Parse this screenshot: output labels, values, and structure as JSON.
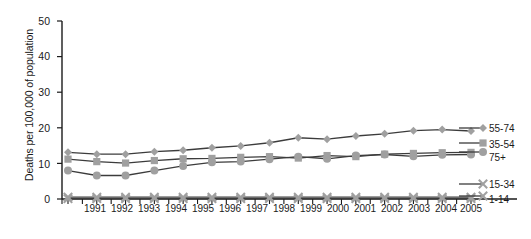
{
  "chart_data": {
    "type": "line",
    "title": "",
    "xlabel": "",
    "ylabel": "Deaths per 100,000 of population",
    "x": [
      1991,
      1992,
      1993,
      1994,
      1995,
      1996,
      1997,
      1998,
      1999,
      2000,
      2001,
      2002,
      2003,
      2004,
      2005
    ],
    "xtick_labels": [
      "1991",
      "1992",
      "1993",
      "1994",
      "1995",
      "1996",
      "1997",
      "1998",
      "1999",
      "2000",
      "2001",
      "2002",
      "2003",
      "2004",
      "2005"
    ],
    "ytick_labels": [
      "0",
      "10",
      "20",
      "30",
      "40",
      "50"
    ],
    "yticks": [
      0,
      10,
      20,
      30,
      40,
      50
    ],
    "ylim": [
      0,
      50
    ],
    "grid": false,
    "legend_position": "right-inline",
    "series": [
      {
        "name": "55-74",
        "marker": "diamond",
        "values": [
          13.1,
          12.6,
          12.6,
          13.3,
          13.7,
          14.4,
          14.9,
          15.8,
          17.2,
          16.8,
          17.7,
          18.3,
          19.2,
          19.5,
          19.1
        ]
      },
      {
        "name": "35-54",
        "marker": "square",
        "values": [
          11.2,
          10.5,
          10.1,
          10.8,
          11.3,
          11.4,
          11.7,
          11.9,
          11.5,
          12.2,
          11.9,
          12.6,
          12.8,
          13.0,
          13.1
        ]
      },
      {
        "name": "75+",
        "marker": "circle",
        "values": [
          8.0,
          6.6,
          6.6,
          8.0,
          9.3,
          10.3,
          10.5,
          11.2,
          11.9,
          11.3,
          12.2,
          12.5,
          12.0,
          12.4,
          12.5
        ]
      },
      {
        "name": "15-34",
        "marker": "cross",
        "values": [
          0.55,
          0.5,
          0.5,
          0.5,
          0.5,
          0.5,
          0.5,
          0.5,
          0.5,
          0.5,
          0.5,
          0.5,
          0.5,
          0.5,
          0.5
        ]
      },
      {
        "name": "1-14",
        "marker": "cross",
        "values": [
          0.1,
          0.1,
          0.1,
          0.1,
          0.1,
          0.1,
          0.1,
          0.1,
          0.1,
          0.1,
          0.1,
          0.1,
          0.1,
          0.1,
          0.1
        ]
      }
    ],
    "legend_entries": [
      {
        "label": "55-74"
      },
      {
        "label": "35-54"
      },
      {
        "label": "75+"
      },
      {
        "label": "15-34"
      },
      {
        "label": "1-14"
      }
    ],
    "colors": {
      "marker": "#a0a0a0",
      "line": "#3c3c3c",
      "axis": "#1a1a1a",
      "text": "#1a1a1a",
      "background": "#ffffff"
    }
  }
}
